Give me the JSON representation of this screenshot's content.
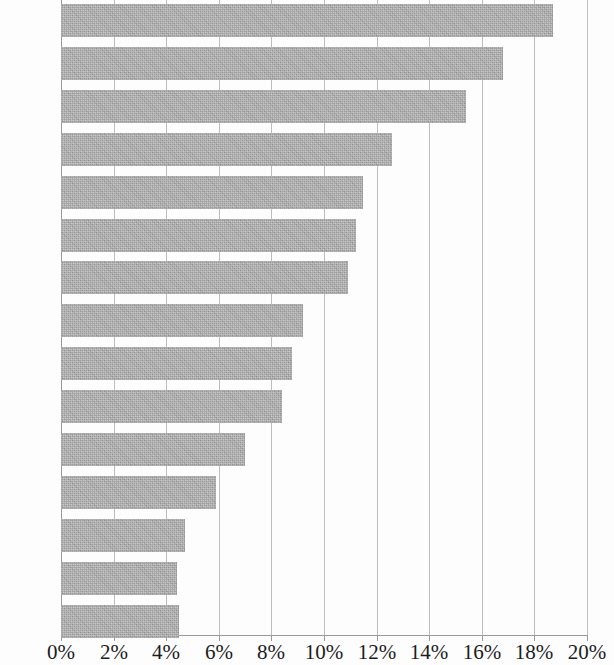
{
  "chart_data": {
    "type": "bar",
    "orientation": "horizontal",
    "title": "",
    "subtitle": "",
    "xlabel": "",
    "ylabel": "",
    "categories": [
      "NOK",
      "SEK",
      "JPY",
      "BRL",
      "MXN",
      "EUR",
      "ZAR",
      "CHF",
      "AUD",
      "CAD",
      "MYR",
      "NZD",
      "GBP",
      "SGD",
      "KRW"
    ],
    "values": [
      18.7,
      16.8,
      15.4,
      12.6,
      11.5,
      11.2,
      10.9,
      9.2,
      8.8,
      8.4,
      7.0,
      5.9,
      4.7,
      4.4,
      4.5
    ],
    "value_unit": "%",
    "xlim": [
      0,
      20
    ],
    "x_ticks": [
      "0%",
      "2%",
      "4%",
      "6%",
      "8%",
      "10%",
      "12%",
      "14%",
      "16%",
      "18%",
      "20%"
    ],
    "x_tick_values": [
      0,
      2,
      4,
      6,
      8,
      10,
      12,
      14,
      16,
      18,
      20
    ],
    "grid": "vertical",
    "legend": "none",
    "bar_color": "#a9a9a9",
    "gridline_color": "#bdbdbd",
    "axis_color": "#9a9a9a"
  }
}
